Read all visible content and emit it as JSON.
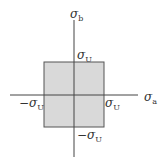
{
  "diagram": {
    "colors": {
      "region_fill": "#d9d9d9",
      "region_stroke": "#555555",
      "axis": "#444444"
    },
    "axes": {
      "vertical": {
        "symbol": "σ",
        "subscript": "b"
      },
      "horizontal": {
        "symbol": "σ",
        "subscript": "a"
      }
    },
    "labels": {
      "top": {
        "prefix": "",
        "symbol": "σ",
        "subscript": "U"
      },
      "right": {
        "prefix": "",
        "symbol": "σ",
        "subscript": "U"
      },
      "left": {
        "prefix": "−",
        "symbol": "σ",
        "subscript": "U"
      },
      "bottom": {
        "prefix": "−",
        "symbol": "σ",
        "subscript": "U"
      }
    }
  }
}
